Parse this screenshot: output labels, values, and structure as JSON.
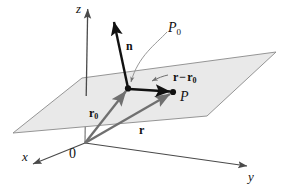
{
  "figure": {
    "background_color": "#ffffff",
    "plane_fill_color": "#e9e9e9",
    "plane_stroke_color": "#8a8a8a",
    "axis_color": "#4a4a4a",
    "vector_gray_color": "#707070",
    "vector_black_color": "#111111",
    "leader_color": "#808080"
  },
  "axes": [
    {
      "name": "z-axis",
      "label": "z",
      "direction": "up"
    },
    {
      "name": "x-axis",
      "label": "x",
      "direction": "down-left"
    },
    {
      "name": "y-axis",
      "label": "y",
      "direction": "down-right"
    }
  ],
  "labels": {
    "origin": "0",
    "axis_z": "z",
    "axis_x": "x",
    "axis_y": "y",
    "point_p0": "P",
    "point_p0_sub": "0",
    "point_p": "P",
    "vector_n": "n",
    "vector_r0": "r",
    "vector_r0_sub": "0",
    "vector_r": "r",
    "vector_diff_first": "r",
    "vector_diff_minus": "−",
    "vector_diff_second": "r",
    "vector_diff_second_sub": "0"
  },
  "geometry": {
    "origin": {
      "x": 85,
      "y": 143
    },
    "point_p0": {
      "x": 128,
      "y": 88
    },
    "point_p": {
      "x": 173,
      "y": 92
    },
    "plane_corners": [
      {
        "x": 82,
        "y": 78
      },
      {
        "x": 276,
        "y": 52
      },
      {
        "x": 207,
        "y": 116
      },
      {
        "x": 13,
        "y": 133
      }
    ],
    "z_axis_tip": {
      "x": 88,
      "y": 5
    },
    "x_axis_tip": {
      "x": 29,
      "y": 166
    },
    "y_axis_tip": {
      "x": 252,
      "y": 168
    },
    "n_tip": {
      "x": 113,
      "y": 18
    }
  }
}
